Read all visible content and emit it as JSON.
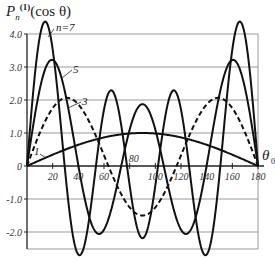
{
  "chart_data": {
    "type": "line",
    "title_parts": {
      "base": "P",
      "sub": "n",
      "sup": "(1)",
      "arg": "(cos θ)"
    },
    "xlabel": "θ0",
    "ylabel": "P_n^(1)(cos θ)",
    "xlim": [
      0,
      180
    ],
    "ylim": [
      -2.5,
      4.0
    ],
    "grid": true,
    "x_ticks": [
      20,
      40,
      60,
      80,
      100,
      120,
      140,
      160,
      180
    ],
    "x_tick_labels": [
      "20",
      "40",
      "60",
      "80",
      "100",
      "120",
      "140",
      "160",
      "180"
    ],
    "y_ticks": [
      4.0,
      3.0,
      2.0,
      1.0,
      0,
      -1.0,
      -2.0
    ],
    "y_tick_labels": [
      "4.0",
      "3.0",
      "2.0",
      "1.0",
      "0",
      "-1.0",
      "-2.0"
    ],
    "x": [
      0,
      10,
      20,
      30,
      40,
      50,
      60,
      70,
      80,
      90,
      100,
      110,
      120,
      130,
      140,
      150,
      160,
      170,
      180
    ],
    "series": [
      {
        "name": "n=1",
        "label": "1",
        "style": "solid",
        "values": [
          0,
          0.17,
          0.34,
          0.5,
          0.64,
          0.77,
          0.87,
          0.94,
          0.98,
          1.0,
          0.98,
          0.94,
          0.87,
          0.77,
          0.64,
          0.5,
          0.34,
          0.17,
          0
        ]
      },
      {
        "name": "n=3",
        "label": "3",
        "style": "dashed",
        "values": [
          0,
          1.02,
          1.79,
          1.97,
          1.33,
          0.09,
          -1.05,
          -1.47,
          -1.14,
          -1.5,
          -1.14,
          -1.47,
          -1.05,
          0.09,
          1.33,
          1.97,
          1.79,
          1.02,
          0
        ]
      },
      {
        "name": "n=5",
        "label": "5",
        "style": "solid",
        "values": [
          0,
          2.42,
          3.03,
          0.98,
          -1.76,
          -1.9,
          0.23,
          1.7,
          1.09,
          1.88,
          1.09,
          1.7,
          0.23,
          -1.9,
          -1.76,
          0.98,
          3.03,
          2.42,
          0
        ]
      },
      {
        "name": "n=7",
        "label": "n=7",
        "style": "solid",
        "values": [
          0,
          4.06,
          1.95,
          -2.47,
          -0.45,
          1.86,
          0.05,
          -1.51,
          -0.79,
          -2.19,
          -0.79,
          -1.51,
          0.05,
          1.86,
          -0.45,
          -2.47,
          1.95,
          4.06,
          0
        ]
      }
    ],
    "legend": "inline-labels"
  }
}
